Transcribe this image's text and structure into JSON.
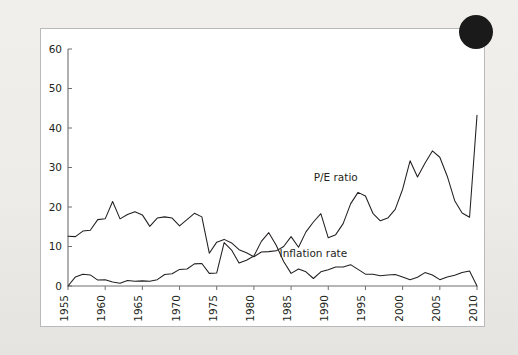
{
  "figure": {
    "background_color": "#eceae7",
    "panel_color": "#ffffff",
    "panel_border_color": "#b9b9b9",
    "corner_badge": "page-corner-badge"
  },
  "chart_data": {
    "type": "line",
    "title": "",
    "subtitle": "",
    "xlabel": "",
    "ylabel": "",
    "xlim": [
      1955,
      2010
    ],
    "ylim": [
      0,
      60
    ],
    "grid": false,
    "legend_position": "inline-annotation",
    "y_ticks": [
      0,
      10,
      20,
      30,
      40,
      50,
      60
    ],
    "x_ticks": [
      1955,
      1960,
      1965,
      1970,
      1975,
      1980,
      1985,
      1990,
      1995,
      2000,
      2005,
      2010
    ],
    "x_tick_labels": [
      "1955",
      "1960",
      "1965",
      "1970",
      "1975",
      "1980",
      "1985",
      "1990",
      "1995",
      "2000",
      "2005",
      "2010"
    ],
    "y_tick_labels": [
      "0",
      "10",
      "20",
      "30",
      "40",
      "50",
      "60"
    ],
    "x": [
      1955,
      1956,
      1957,
      1958,
      1959,
      1960,
      1961,
      1962,
      1963,
      1964,
      1965,
      1966,
      1967,
      1968,
      1969,
      1970,
      1971,
      1972,
      1973,
      1974,
      1975,
      1976,
      1977,
      1978,
      1979,
      1980,
      1981,
      1982,
      1983,
      1984,
      1985,
      1986,
      1987,
      1988,
      1989,
      1990,
      1991,
      1992,
      1993,
      1994,
      1995,
      1996,
      1997,
      1998,
      1999,
      2000,
      2001,
      2002,
      2003,
      2004,
      2005,
      2006,
      2007,
      2008,
      2009,
      2010
    ],
    "series": [
      {
        "name": "P/E ratio",
        "label": "P/E ratio",
        "color": "#231f20",
        "label_x": 1991,
        "label_y": 26.5,
        "values": [
          12.6,
          12.5,
          13.9,
          14.1,
          16.8,
          17.0,
          21.4,
          17.0,
          18.1,
          18.8,
          18.0,
          15.1,
          17.2,
          17.5,
          17.2,
          15.2,
          16.8,
          18.4,
          17.5,
          8.3,
          11.1,
          11.8,
          10.9,
          9.2,
          8.4,
          7.4,
          8.6,
          8.7,
          8.9,
          10.0,
          12.5,
          9.8,
          13.7,
          16.2,
          18.3,
          12.2,
          13.0,
          15.8,
          20.8,
          23.7,
          22.8,
          18.4,
          16.5,
          17.2,
          19.4,
          24.5,
          31.7,
          27.6,
          31.1,
          34.2,
          32.6,
          27.8,
          21.6,
          18.5,
          17.4,
          43.2
        ],
        "series_note": "annual average P/E ratio; 2009 spike to ~54 then drop to ~16.5 in 2010"
      },
      {
        "name": "Inflation rate",
        "label": "Inflation rate",
        "color": "#231f20",
        "label_x": 1988,
        "label_y": 7.4,
        "values": [
          0.0,
          2.3,
          3.0,
          2.8,
          1.5,
          1.6,
          1.0,
          0.7,
          1.4,
          1.2,
          1.3,
          1.2,
          1.6,
          2.9,
          3.1,
          4.2,
          4.3,
          5.6,
          5.7,
          3.2,
          3.3,
          11.0,
          9.1,
          5.8,
          6.5,
          7.6,
          11.3,
          13.5,
          10.3,
          6.2,
          3.2,
          4.3,
          3.6,
          1.9,
          3.6,
          4.1,
          4.8,
          4.8,
          5.4,
          4.2,
          3.0,
          3.0,
          2.6,
          2.8,
          2.9,
          2.3,
          1.6,
          2.2,
          3.4,
          2.8,
          1.6,
          2.3,
          2.7,
          3.4,
          3.8,
          0.0
        ],
        "series_note": "annual CPI inflation rate percent; dips near zero at 2009"
      }
    ]
  }
}
